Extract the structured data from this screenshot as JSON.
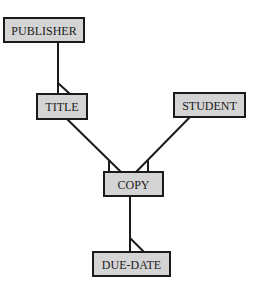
{
  "diagram": {
    "type": "entity-relationship",
    "notation": "crow's foot (one-to-many)",
    "entities": [
      {
        "id": "publisher",
        "label": "PUBLISHER"
      },
      {
        "id": "title",
        "label": "TITLE"
      },
      {
        "id": "student",
        "label": "STUDENT"
      },
      {
        "id": "copy",
        "label": "COPY"
      },
      {
        "id": "due_date",
        "label": "DUE-DATE"
      }
    ],
    "relationships": [
      {
        "from": "publisher",
        "to": "title",
        "cardinality": "one-to-many",
        "many_side": "title"
      },
      {
        "from": "title",
        "to": "copy",
        "cardinality": "one-to-many",
        "many_side": "copy"
      },
      {
        "from": "student",
        "to": "copy",
        "cardinality": "one-to-many",
        "many_side": "copy"
      },
      {
        "from": "copy",
        "to": "due_date",
        "cardinality": "one-to-many",
        "many_side": "due_date"
      }
    ],
    "colors": {
      "box_fill": "#d4d4d4",
      "stroke": "#1a1a1a",
      "background": "#ffffff"
    }
  }
}
